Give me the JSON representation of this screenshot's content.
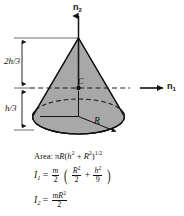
{
  "figure": {
    "kind": "solid-cone-mass-properties-diagram",
    "background_color": "#ffffff",
    "ink_color": "#111111",
    "cone_fill_color": "#a8a8a8",
    "base_fill_color": "#b4b4b4"
  },
  "axes": {
    "vertical_axis_label": "n",
    "vertical_axis_subscript": "2",
    "horizontal_axis_label": "n",
    "horizontal_axis_subscript": "1"
  },
  "dimensions": [
    {
      "name": "upper-height",
      "numerator": "2h",
      "denominator": "3",
      "text": "2h/3"
    },
    {
      "name": "lower-height",
      "numerator": "h",
      "denominator": "3",
      "text": "h/3"
    }
  ],
  "labels": {
    "centroid": "C",
    "radius": "R"
  },
  "formulas": {
    "area_prefix": "Area:",
    "area_expression": "πR(h² + R²)¹ᐟ²",
    "area_pi": "π",
    "area_R": "R",
    "area_open": "(",
    "area_h": "h",
    "area_h_exp": "2",
    "area_plus": "+",
    "area_R2": "R",
    "area_R2_exp": "2",
    "area_close": ")",
    "area_exp": "1/2",
    "i1_label": "I",
    "i1_sub": "1",
    "i1_equals": "=",
    "i1_coeff_num": "m",
    "i1_coeff_den": "2",
    "i1_term1_num": "R",
    "i1_term1_num_exp": "2",
    "i1_term1_den": "2",
    "i1_plus": "+",
    "i1_term2_num": "h",
    "i1_term2_num_exp": "2",
    "i1_term2_den": "9",
    "i2_label": "I",
    "i2_sub": "2",
    "i2_equals": "=",
    "i2_num_m": "m",
    "i2_num_R": "R",
    "i2_num_exp": "2",
    "i2_den": "2"
  }
}
